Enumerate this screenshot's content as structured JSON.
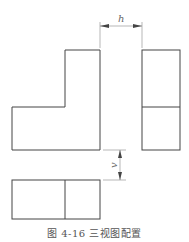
{
  "diagram": {
    "title": "三视图配置",
    "caption": "图 4-16   三视图配置",
    "views": [
      {
        "name": "front-view",
        "shape": "L-shape"
      },
      {
        "name": "side-view",
        "shape": "rectangle split horizontally"
      },
      {
        "name": "top-view",
        "shape": "rectangle split vertically"
      }
    ],
    "dimensions": {
      "horizontal_label": "h",
      "vertical_label": "v"
    },
    "colors": {
      "line": "#444444",
      "dim_line": "#888888"
    }
  }
}
